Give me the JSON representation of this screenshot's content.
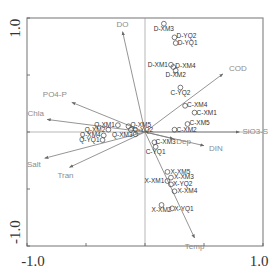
{
  "chart_data": {
    "type": "scatter",
    "subtype": "ordination-biplot",
    "title": "",
    "xlabel": "",
    "ylabel": "",
    "xlim": [
      -1.0,
      1.0
    ],
    "ylim": [
      -1.0,
      1.0
    ],
    "x_tick_labels": [
      "-1.0",
      "1.0"
    ],
    "y_tick_labels": [
      "1.0",
      "-1.0"
    ],
    "grid": false,
    "zero_lines": true,
    "legend": "none",
    "arrows": [
      {
        "name": "DO",
        "x": -0.19,
        "y": 0.88
      },
      {
        "name": "COD",
        "x": 0.66,
        "y": 0.51
      },
      {
        "name": "SiO3-S",
        "x": 0.8,
        "y": 0.0
      },
      {
        "name": "DIN",
        "x": 0.5,
        "y": -0.12
      },
      {
        "name": "Dep",
        "x": 0.24,
        "y": -0.06
      },
      {
        "name": "PO4-P",
        "x": -0.62,
        "y": 0.26
      },
      {
        "name": "Chla",
        "x": -0.83,
        "y": 0.11
      },
      {
        "name": "Salt",
        "x": -0.85,
        "y": -0.23
      },
      {
        "name": "Tran",
        "x": -0.64,
        "y": -0.31
      },
      {
        "name": "Temp",
        "x": 0.42,
        "y": -0.93
      }
    ],
    "points": [
      {
        "label": "D-XM3",
        "x": 0.16,
        "y": 0.95
      },
      {
        "label": "D-YQ2",
        "x": 0.25,
        "y": 0.83
      },
      {
        "label": "D-YQ1",
        "x": 0.26,
        "y": 0.78
      },
      {
        "label": "D-XM1",
        "x": 0.22,
        "y": 0.59
      },
      {
        "label": "D-XM4",
        "x": 0.24,
        "y": 0.57
      },
      {
        "label": "D-XM2",
        "x": 0.26,
        "y": 0.54
      },
      {
        "label": "C-YQ2",
        "x": 0.3,
        "y": 0.39
      },
      {
        "label": "C-XM4",
        "x": 0.34,
        "y": 0.23
      },
      {
        "label": "C-XM1",
        "x": 0.42,
        "y": 0.17
      },
      {
        "label": "C-XM5",
        "x": 0.36,
        "y": 0.07
      },
      {
        "label": "C-XM2",
        "x": 0.25,
        "y": 0.02
      },
      {
        "label": "C-XM3",
        "x": 0.08,
        "y": -0.09
      },
      {
        "label": "C-YQ1",
        "x": 0.09,
        "y": -0.13
      },
      {
        "label": "X-XM5",
        "x": 0.19,
        "y": -0.35
      },
      {
        "label": "X-XM3",
        "x": 0.22,
        "y": -0.4
      },
      {
        "label": "X-XM1",
        "x": 0.19,
        "y": -0.43
      },
      {
        "label": "X-YQ2",
        "x": 0.22,
        "y": -0.46
      },
      {
        "label": "X-XM4",
        "x": 0.25,
        "y": -0.52
      },
      {
        "label": "X-XM2",
        "x": 0.14,
        "y": -0.64
      },
      {
        "label": "X-YQ1",
        "x": 0.23,
        "y": -0.67
      },
      {
        "label": "Q-XM1",
        "x": -0.23,
        "y": 0.06
      },
      {
        "label": "Q-XM5",
        "x": -0.14,
        "y": 0.05
      },
      {
        "label": "Q-XM2",
        "x": -0.31,
        "y": 0.02
      },
      {
        "label": "Q-YQ2",
        "x": -0.12,
        "y": 0.02
      },
      {
        "label": "Q-XM4",
        "x": -0.35,
        "y": -0.03
      },
      {
        "label": "Q-XM3",
        "x": -0.08,
        "y": -0.02
      },
      {
        "label": "Q-YQ1",
        "x": -0.36,
        "y": -0.07
      }
    ]
  }
}
